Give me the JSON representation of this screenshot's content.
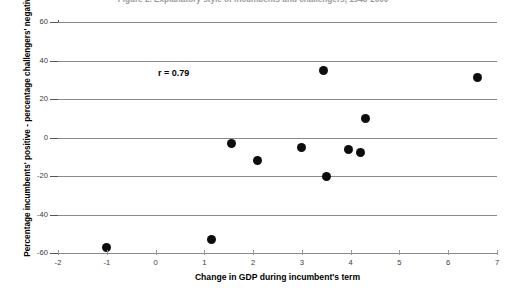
{
  "chart_data": {
    "type": "scatter",
    "title": "Figure 2. Explanatory style of incumbents and challengers, 1948-2000",
    "xlabel": "Change in GDP during incumbent's term",
    "ylabel": "Percentage incumbents' positive - percentage challengers' negative",
    "xlim": [
      -2,
      7
    ],
    "ylim": [
      -60,
      60
    ],
    "xticks": [
      -2,
      -1,
      0,
      1,
      2,
      3,
      4,
      5,
      6,
      7
    ],
    "yticks": [
      60,
      40,
      20,
      0,
      -20,
      -40,
      -60
    ],
    "grid": "horizontal",
    "legend": "none",
    "annotations": [
      {
        "text": "r = 0.79",
        "x": 0.05,
        "y": 33
      }
    ],
    "marker_color": "#0d0d0d",
    "marker_size": 9,
    "points": [
      {
        "x": -1.0,
        "y": -57
      },
      {
        "x": 1.15,
        "y": -53
      },
      {
        "x": 1.55,
        "y": -3
      },
      {
        "x": 2.1,
        "y": -12
      },
      {
        "x": 3.0,
        "y": -5
      },
      {
        "x": 3.45,
        "y": 35
      },
      {
        "x": 3.5,
        "y": -20
      },
      {
        "x": 3.95,
        "y": -6
      },
      {
        "x": 4.2,
        "y": -8
      },
      {
        "x": 4.3,
        "y": 10
      },
      {
        "x": 6.6,
        "y": 31
      }
    ]
  },
  "axes": {
    "y_tick_labels": [
      "60",
      "40",
      "20",
      "0",
      "-20",
      "-40",
      "-60"
    ],
    "x_tick_labels": [
      "-2",
      "-1",
      "0",
      "1",
      "2",
      "3",
      "4",
      "5",
      "6",
      "7"
    ]
  },
  "colors": {
    "marker": "#0d0d0d",
    "grid": "#8a8a8a",
    "axis": "#555555",
    "text": "#000000",
    "title": "#9a9a9a",
    "background": "#ffffff"
  }
}
